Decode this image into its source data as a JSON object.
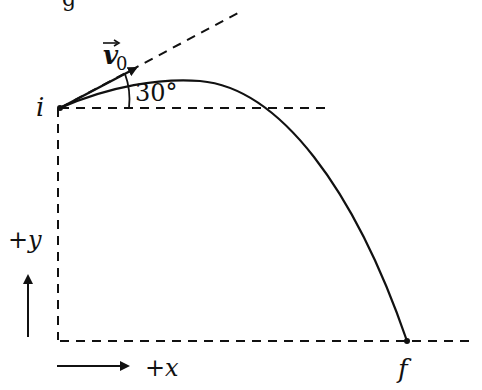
{
  "header": {
    "clipped_text": "g"
  },
  "diagram": {
    "type": "projectile-trajectory",
    "colors": {
      "stroke": "#111111",
      "background": "#ffffff"
    },
    "points": {
      "initial": {
        "label": "i"
      },
      "final": {
        "label": "f"
      }
    },
    "velocity": {
      "label": "v",
      "subscript": "0"
    },
    "angle": {
      "label": "30°"
    },
    "axes": {
      "y": {
        "label": "+y"
      },
      "x": {
        "label": "+x"
      }
    }
  }
}
